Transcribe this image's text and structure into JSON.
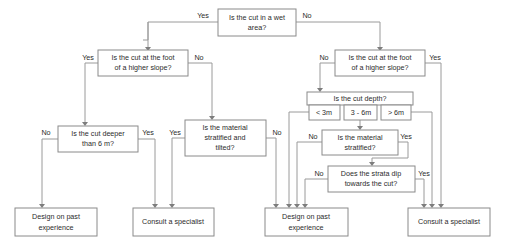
{
  "diagram": {
    "colors": {
      "box_stroke": "#8a8a8a",
      "line_stroke": "#9a9a9a",
      "arrow_fill": "#7d7d7d",
      "text": "#2b2b2b",
      "background": "#ffffff"
    }
  },
  "nodes": {
    "wet_area": {
      "line1": "Is the cut in a wet",
      "line2": "area?"
    },
    "slope_left": {
      "line1": "Is the cut at the foot",
      "line2": "of a higher slope?"
    },
    "slope_right": {
      "line1": "Is the cut at the foot",
      "line2": "of a higher slope?"
    },
    "deeper_6m": {
      "line1": "Is the cut deeper",
      "line2": "than 6 m?"
    },
    "stratified_tilted": {
      "line1": "Is the material",
      "line2": "stratified and",
      "line3": "tilted?"
    },
    "cut_depth": {
      "header": "Is the cut depth?",
      "opt_low": "< 3m",
      "opt_mid": "3 - 6m",
      "opt_high": "> 6m"
    },
    "stratified": {
      "line1": "Is the material",
      "line2": "stratified?"
    },
    "strata_dip": {
      "line1": "Does the strata dip",
      "line2": "towards the cut?"
    },
    "design_left": {
      "line1": "Design on past",
      "line2": "experience"
    },
    "consult_left": {
      "line1": "Consult a specialist"
    },
    "design_right": {
      "line1": "Design on past",
      "line2": "experience"
    },
    "consult_right": {
      "line1": "Consult a specialist"
    }
  },
  "edge_labels": {
    "wet_yes": "Yes",
    "wet_no": "No",
    "slope_left_yes": "Yes",
    "slope_left_no": "No",
    "slope_right_no": "No",
    "slope_right_yes": "Yes",
    "deeper_no": "No",
    "deeper_yes": "Yes",
    "tilted_yes": "Yes",
    "tilted_no": "No",
    "stratified_no": "No",
    "stratified_yes": "Yes",
    "dip_no": "No",
    "dip_yes": "Yes"
  }
}
